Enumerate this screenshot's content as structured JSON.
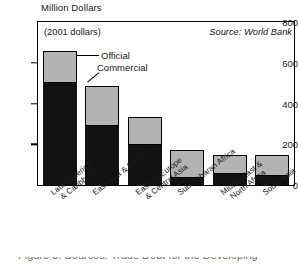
{
  "chart_data": {
    "type": "bar",
    "title": "Million Dollars",
    "subtitle": "(2001 dollars)",
    "source_note": "Source: World Bank",
    "xlabel": "",
    "ylabel": "Million Dollars",
    "ylim": [
      0,
      800
    ],
    "yticks": [
      0,
      200,
      400,
      600,
      800
    ],
    "grid": false,
    "stacked": true,
    "legend_position": "inside-top-left",
    "categories": [
      "Latin America & Caribbean",
      "East Asia & Pacific",
      "Eastern Europe & Central Asia",
      "Sub-Saharan Africa",
      "Middle East & North Africa",
      "South Asia"
    ],
    "category_lines": [
      [
        "Latin America",
        "& Caribbean"
      ],
      [
        "East Asia & Pacific",
        ""
      ],
      [
        "Eastern Europe",
        "& Central Asia"
      ],
      [
        "Sub-Saharan Africa",
        ""
      ],
      [
        "Middle East &",
        "North Africa"
      ],
      [
        "South Asia",
        ""
      ]
    ],
    "series": [
      {
        "name": "Commercial",
        "color": "#111111",
        "values": [
          500,
          290,
          195,
          35,
          55,
          45
        ]
      },
      {
        "name": "Official",
        "color": "#b3b3b3",
        "values": [
          160,
          195,
          140,
          135,
          95,
          105
        ]
      }
    ],
    "totals": [
      660,
      485,
      335,
      170,
      150,
      150
    ]
  },
  "legend": {
    "official_label": "Official",
    "commercial_label": "Commercial"
  },
  "caption": {
    "text": "Figure 3. Sources: Trade Debt for the Developing"
  }
}
